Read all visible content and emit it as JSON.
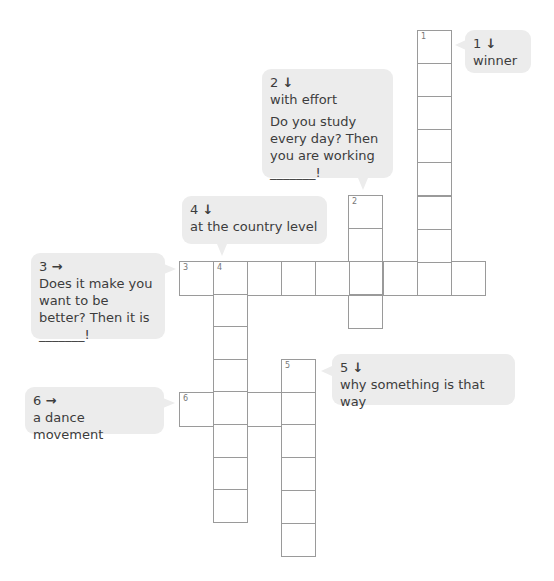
{
  "puzzle": {
    "cell_size": 34,
    "words": [
      {
        "number": "1",
        "direction": "down",
        "start_x": 417,
        "start_y": 30,
        "length": 8,
        "cell_h": 33.1
      },
      {
        "number": "2",
        "direction": "down",
        "start_x": 348,
        "start_y": 195,
        "length": 4,
        "cell_h": 33.2
      },
      {
        "number": "3",
        "direction": "across",
        "start_x": 179,
        "start_y": 261,
        "length": 9,
        "cell_w": 34
      },
      {
        "number": "4",
        "direction": "down",
        "start_x": 213,
        "start_y": 261,
        "length": 8,
        "cell_h": 32.6
      },
      {
        "number": "5",
        "direction": "down",
        "start_x": 281,
        "start_y": 359,
        "length": 6,
        "cell_h": 32.7
      },
      {
        "number": "6",
        "direction": "across",
        "start_x": 179,
        "start_y": 392,
        "length": 4,
        "cell_w": 34
      }
    ]
  },
  "clues": {
    "c1": {
      "label": "1",
      "arrow": "↓",
      "text": "winner",
      "extra": ""
    },
    "c2": {
      "label": "2",
      "arrow": "↓",
      "text": "with effort",
      "extra": "Do you study every day? Then you are working _______!"
    },
    "c3": {
      "label": "3",
      "arrow": "→",
      "text": "Does it make you want to be better? Then it is _______!",
      "extra": ""
    },
    "c4": {
      "label": "4",
      "arrow": "↓",
      "text": "at the country level",
      "extra": ""
    },
    "c5": {
      "label": "5",
      "arrow": "↓",
      "text": "why something is that way",
      "extra": ""
    },
    "c6": {
      "label": "6",
      "arrow": "→",
      "text": "a dance movement",
      "extra": ""
    }
  },
  "colors": {
    "bubble_bg": "#ececec",
    "grid_line": "#9a9a9a",
    "text": "#3c3c3c"
  }
}
